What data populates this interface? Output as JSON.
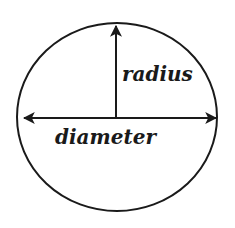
{
  "diagram": {
    "labels": {
      "radius": "radius",
      "diameter": "diameter"
    },
    "colors": {
      "stroke": "#1a1a1a",
      "background": "#ffffff"
    }
  }
}
